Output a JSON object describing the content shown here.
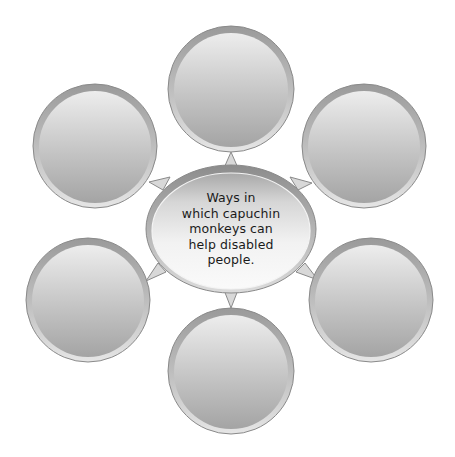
{
  "diagram": {
    "type": "bubble-map",
    "center": {
      "lines": [
        "Ways in",
        "which capuchin",
        "monkeys can",
        "help disabled",
        "people."
      ],
      "full_text": "Ways in which capuchin monkeys can help disabled people."
    },
    "bubbles": [
      {
        "position": "top",
        "label": ""
      },
      {
        "position": "top-right",
        "label": ""
      },
      {
        "position": "bottom-right",
        "label": ""
      },
      {
        "position": "bottom",
        "label": ""
      },
      {
        "position": "bottom-left",
        "label": ""
      },
      {
        "position": "top-left",
        "label": ""
      }
    ],
    "colors": {
      "background": "#ffffff",
      "bubble_fill_light": "#ececec",
      "bubble_fill_dark": "#a9a9a9",
      "bubble_rim": "#8a8a8a",
      "center_fill_light": "#f7f7f7",
      "center_fill_dark": "#b5b5b5",
      "text": "#1a1a1a"
    }
  }
}
